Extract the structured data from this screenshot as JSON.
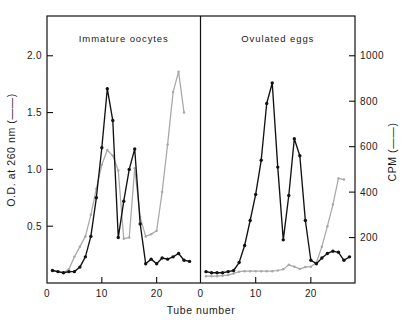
{
  "chart_data": {
    "type": "line",
    "title": "",
    "xlabel": "Tube number",
    "ylabel": "O.D. at 260 nm (——)",
    "y2label": "CPM (——)",
    "xlim": [
      0,
      28
    ],
    "ylim": [
      0,
      2.35
    ],
    "y2lim": [
      0,
      1175
    ],
    "xticks": [
      0,
      10,
      20
    ],
    "xticklabels": [
      "0",
      "10",
      "20"
    ],
    "yticks": [
      0.5,
      1.0,
      1.5,
      2.0
    ],
    "yticklabels": [
      "0.5",
      "1.0",
      "1.5",
      "2.0"
    ],
    "y2ticks": [
      200,
      400,
      600,
      800,
      1000
    ],
    "y2ticklabels": [
      "200",
      "400",
      "600",
      "800",
      "1000"
    ],
    "grid": false,
    "legend": "none",
    "panels": [
      {
        "label": "Immature oocytes",
        "series": [
          {
            "name": "O.D. at 260 nm",
            "axis": "left",
            "color": "#121212",
            "x": [
              1,
              2,
              3,
              4,
              5,
              6,
              7,
              8,
              9,
              10,
              11,
              12,
              13,
              14,
              15,
              16,
              17,
              18,
              19,
              20,
              21,
              22,
              23,
              24,
              25,
              26
            ],
            "y": [
              0.11,
              0.1,
              0.09,
              0.1,
              0.1,
              0.14,
              0.23,
              0.41,
              0.75,
              1.19,
              1.71,
              1.43,
              0.4,
              0.72,
              1.0,
              1.18,
              0.52,
              0.17,
              0.21,
              0.17,
              0.22,
              0.21,
              0.23,
              0.26,
              0.2,
              0.19
            ]
          },
          {
            "name": "CPM",
            "axis": "right",
            "color": "#a8a8a8",
            "x": [
              1,
              2,
              3,
              4,
              5,
              6,
              7,
              8,
              9,
              10,
              11,
              12,
              13,
              14,
              15,
              16,
              17,
              18,
              19,
              20,
              21,
              22,
              23,
              24,
              25
            ],
            "y": [
              55,
              50,
              45,
              60,
              115,
              160,
              205,
              300,
              415,
              520,
              585,
              560,
              495,
              195,
              200,
              505,
              290,
              205,
              215,
              230,
              400,
              610,
              840,
              930,
              750,
              595
            ]
          }
        ]
      },
      {
        "label": "Ovulated eggs",
        "series": [
          {
            "name": "O.D. at 260 nm",
            "axis": "left",
            "color": "#121212",
            "x": [
              1,
              2,
              3,
              4,
              5,
              6,
              7,
              8,
              9,
              10,
              11,
              12,
              13,
              14,
              15,
              16,
              17,
              18,
              19,
              20,
              21,
              22,
              23,
              24,
              25,
              26,
              27
            ],
            "y": [
              0.1,
              0.09,
              0.09,
              0.09,
              0.1,
              0.11,
              0.18,
              0.33,
              0.55,
              0.78,
              1.08,
              1.58,
              1.76,
              1.02,
              0.38,
              0.77,
              1.27,
              1.12,
              0.55,
              0.2,
              0.17,
              0.22,
              0.26,
              0.28,
              0.27,
              0.2,
              0.23
            ]
          },
          {
            "name": "CPM",
            "axis": "right",
            "color": "#a8a8a8",
            "x": [
              1,
              2,
              3,
              4,
              5,
              6,
              7,
              8,
              9,
              10,
              11,
              12,
              13,
              14,
              15,
              16,
              17,
              18,
              19,
              20,
              21,
              22,
              23,
              24,
              25,
              26
            ],
            "y": [
              30,
              30,
              30,
              32,
              35,
              42,
              50,
              52,
              52,
              52,
              52,
              52,
              52,
              55,
              60,
              80,
              72,
              62,
              70,
              72,
              90,
              160,
              250,
              345,
              460,
              455
            ]
          }
        ]
      }
    ]
  }
}
